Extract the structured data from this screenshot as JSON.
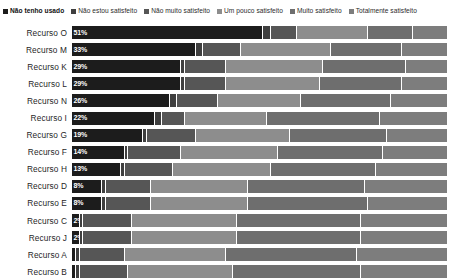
{
  "legend": {
    "position": "top-left",
    "items": [
      {
        "label": "Não tenho usado",
        "color": "#1c1c1c",
        "emphasis": true
      },
      {
        "label": "Não estou satisfeito",
        "color": "#3f3f3f",
        "emphasis": false
      },
      {
        "label": "Não muito satisfeito",
        "color": "#565656",
        "emphasis": false
      },
      {
        "label": "Um pouco satisfeito",
        "color": "#8d8d8d",
        "emphasis": false
      },
      {
        "label": "Muito satisfeito",
        "color": "#6e6e6e",
        "emphasis": false
      },
      {
        "label": "Totalmente satisfeito",
        "color": "#7d7d7d",
        "emphasis": false
      }
    ]
  },
  "chart_data": {
    "type": "bar",
    "orientation": "horizontal",
    "stacked": true,
    "stack_mode": "percent",
    "title": "",
    "subtitle": "",
    "xlabel": "",
    "ylabel": "",
    "xlim": [
      0,
      100
    ],
    "grid": false,
    "axis_visible": false,
    "legend_position": "top-left",
    "categories": [
      "Recurso O",
      "Recurso M",
      "Recurso K",
      "Recurso L",
      "Recurso N",
      "Recurso I",
      "Recurso G",
      "Recurso F",
      "Recurso H",
      "Recurso D",
      "Recurso E",
      "Recurso C",
      "Recurso J",
      "Recurso A",
      "Recurso B"
    ],
    "series": [
      {
        "name": "Não tenho usado",
        "color": "#1c1c1c",
        "values": [
          51,
          33,
          29,
          29,
          26,
          22,
          19,
          14,
          13,
          8,
          8,
          2,
          2,
          1,
          1
        ]
      },
      {
        "name": "Não estou satisfeito",
        "color": "#3f3f3f",
        "values": [
          2,
          2,
          1,
          1,
          2,
          2,
          1,
          1,
          1,
          1,
          1,
          1,
          1,
          1,
          1
        ]
      },
      {
        "name": "Não muito satisfeito",
        "color": "#565656",
        "values": [
          7,
          10,
          11,
          11,
          11,
          6,
          13,
          14,
          13,
          12,
          12,
          13,
          13,
          12,
          13
        ]
      },
      {
        "name": "Um pouco satisfeito",
        "color": "#8d8d8d",
        "values": [
          19,
          24,
          26,
          25,
          22,
          22,
          25,
          26,
          26,
          26,
          26,
          28,
          28,
          27,
          28
        ]
      },
      {
        "name": "Muito satisfeito",
        "color": "#6e6e6e",
        "values": [
          12,
          19,
          22,
          22,
          24,
          30,
          26,
          28,
          28,
          31,
          32,
          33,
          33,
          35,
          34
        ]
      },
      {
        "name": "Totalmente satisfeito",
        "color": "#7d7d7d",
        "values": [
          9,
          12,
          11,
          12,
          15,
          18,
          16,
          17,
          19,
          22,
          21,
          23,
          23,
          24,
          23
        ]
      }
    ],
    "data_labels": {
      "series": "Não tenho usado",
      "format": "{v}%",
      "values": [
        "51%",
        "33%",
        "29%",
        "29%",
        "26%",
        "22%",
        "19%",
        "14%",
        "13%",
        "8%",
        "8%",
        "2%",
        "2%",
        "",
        ""
      ]
    }
  }
}
